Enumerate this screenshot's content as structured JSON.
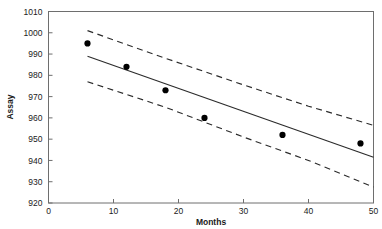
{
  "chart_data": {
    "type": "scatter",
    "title": "",
    "xlabel": "Months",
    "ylabel": "Assay",
    "xlim": [
      0,
      50
    ],
    "ylim": [
      920,
      1010
    ],
    "xticks": [
      0,
      10,
      20,
      30,
      40,
      50
    ],
    "yticks": [
      920,
      930,
      940,
      950,
      960,
      970,
      980,
      990,
      1000,
      1010
    ],
    "grid": false,
    "legend": "none",
    "series": [
      {
        "name": "Assay observations",
        "type": "scatter",
        "marker": "filled-circle",
        "color": "#000000",
        "x": [
          6,
          12,
          18,
          24,
          36,
          48
        ],
        "y": [
          995,
          984,
          973,
          960,
          952,
          948
        ]
      },
      {
        "name": "Regression fit",
        "type": "line",
        "style": "solid",
        "color": "#2b2b2b",
        "x": [
          6,
          50
        ],
        "y": [
          989,
          941.5
        ]
      },
      {
        "name": "Upper confidence limit",
        "type": "line",
        "style": "dashed",
        "color": "#2b2b2b",
        "x": [
          6,
          18,
          30,
          40,
          50
        ],
        "y": [
          1001,
          988,
          975.5,
          965.5,
          956.5
        ]
      },
      {
        "name": "Lower confidence limit",
        "type": "line",
        "style": "dashed",
        "color": "#2b2b2b",
        "x": [
          6,
          18,
          30,
          40,
          50
        ],
        "y": [
          977,
          965,
          951,
          940,
          927.5
        ]
      }
    ]
  },
  "axis": {
    "x_title": "Months",
    "y_title": "Assay",
    "x_tick_labels": [
      "0",
      "10",
      "20",
      "30",
      "40",
      "50"
    ],
    "y_tick_labels": [
      "920",
      "930",
      "940",
      "950",
      "960",
      "970",
      "980",
      "990",
      "1000",
      "1010"
    ]
  },
  "colors": {
    "frame": "#6e6e6e",
    "data": "#000000",
    "line": "#2b2b2b",
    "background": "#ffffff"
  }
}
